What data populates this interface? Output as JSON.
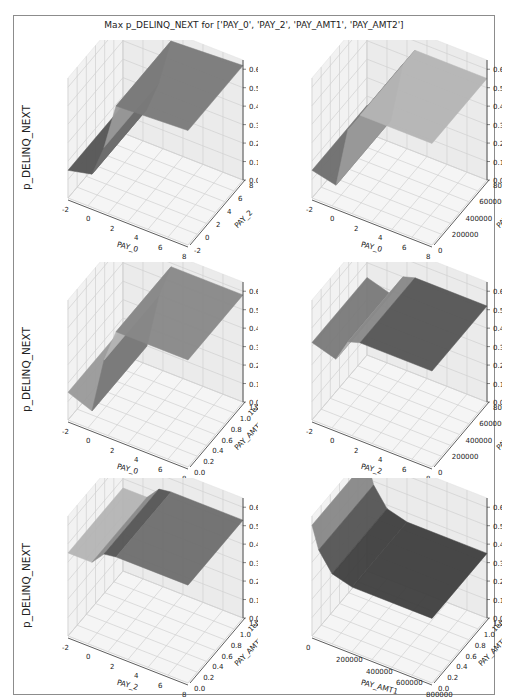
{
  "title": "Max p_DELINQ_NEXT for ['PAY_0', 'PAY_2', 'PAY_AMT1', 'PAY_AMT2']",
  "chart_data": [
    {
      "type": "surface3d",
      "title": "",
      "xlabel": "PAY_0",
      "ylabel": "PAY_2",
      "zlabel": "p_DELINQ_NEXT",
      "xticks": [
        "-2",
        "0",
        "2",
        "4",
        "6",
        "8"
      ],
      "yticks": [
        "-2",
        "0",
        "2",
        "4",
        "6",
        "8"
      ],
      "zticks": [
        "0.0",
        "0.1",
        "0.2",
        "0.3",
        "0.4",
        "0.5",
        "0.6"
      ],
      "zlim": [
        0,
        0.65
      ],
      "description": "Surface low (~0.15) for PAY_0 <= 0, rising stepwise to ~0.6 for PAY_0 >= 2; steps also vary across PAY_2",
      "x": [
        -2,
        0,
        1,
        2,
        8
      ],
      "z_by_x": [
        0.15,
        0.18,
        0.35,
        0.6,
        0.62
      ]
    },
    {
      "type": "surface3d",
      "xlabel": "PAY_0",
      "ylabel": "PAY_AMT1",
      "zlabel": "",
      "xticks": [
        "-2",
        "0",
        "2",
        "4",
        "6",
        "8"
      ],
      "yticks": [
        "0",
        "200000",
        "400000",
        "600000",
        "800000"
      ],
      "zticks": [
        "0.0",
        "0.1",
        "0.2",
        "0.3",
        "0.4",
        "0.5",
        "0.6"
      ],
      "zlim": [
        0,
        0.65
      ],
      "description": "Low (~0.15) for PAY_0 <= 0, rising to ~0.55 for PAY_0 >= 2, dip at low PAY_AMT1",
      "x": [
        -2,
        0,
        1,
        2,
        8
      ],
      "z_by_x": [
        0.15,
        0.12,
        0.45,
        0.55,
        0.55
      ]
    },
    {
      "type": "surface3d",
      "xlabel": "PAY_0",
      "ylabel": "PAY_AMT2",
      "zlabel": "p_DELINQ_NEXT",
      "xticks": [
        "-2",
        "0",
        "2",
        "4",
        "6",
        "8"
      ],
      "yticks": [
        "0.0",
        "0.2",
        "0.4",
        "0.6",
        "0.8",
        "1.0",
        "1.2"
      ],
      "y_offset_label": "1e6",
      "zticks": [
        "0.0",
        "0.1",
        "0.2",
        "0.3",
        "0.4",
        "0.5",
        "0.6"
      ],
      "zlim": [
        0,
        0.65
      ],
      "description": "Low (~0.15) for PAY_0 <= 0, steep rise to ~0.58 for PAY_0 >= 2",
      "x": [
        -2,
        0,
        1,
        2,
        8
      ],
      "z_by_x": [
        0.15,
        0.1,
        0.4,
        0.58,
        0.58
      ]
    },
    {
      "type": "surface3d",
      "xlabel": "PAY_2",
      "ylabel": "PAY_AMT1",
      "zlabel": "",
      "xticks": [
        "-2",
        "0",
        "2",
        "4",
        "6",
        "8"
      ],
      "yticks": [
        "0",
        "200000",
        "400000",
        "600000",
        "800000"
      ],
      "zticks": [
        "0.0",
        "0.1",
        "0.2",
        "0.3",
        "0.4",
        "0.5",
        "0.6"
      ],
      "zlim": [
        0,
        0.65
      ],
      "description": "Mostly flat ~0.45-0.55, small dip near PAY_2 = 0, dark ridge near PAY_2 = 1",
      "x": [
        -2,
        0,
        1,
        2,
        8
      ],
      "z_by_x": [
        0.42,
        0.38,
        0.5,
        0.52,
        0.52
      ]
    },
    {
      "type": "surface3d",
      "xlabel": "PAY_2",
      "ylabel": "PAY_AMT2",
      "zlabel": "p_DELINQ_NEXT",
      "xticks": [
        "-2",
        "0",
        "2",
        "4",
        "6",
        "8"
      ],
      "yticks": [
        "0.0",
        "0.2",
        "0.4",
        "0.6",
        "0.8",
        "1.0",
        "1.2"
      ],
      "y_offset_label": "1e6",
      "zticks": [
        "0.0",
        "0.1",
        "0.2",
        "0.3",
        "0.4",
        "0.5",
        "0.6"
      ],
      "zlim": [
        0,
        0.65
      ],
      "description": "Mostly flat ~0.48-0.55 across PAY_2 and PAY_AMT2",
      "x": [
        -2,
        0,
        1,
        2,
        8
      ],
      "z_by_x": [
        0.45,
        0.45,
        0.52,
        0.53,
        0.53
      ]
    },
    {
      "type": "surface3d",
      "xlabel": "PAY_AMT1",
      "ylabel": "PAY_AMT2",
      "zlabel": "",
      "xticks": [
        "0",
        "200000",
        "400000",
        "600000",
        "800000"
      ],
      "yticks": [
        "0.0",
        "0.2",
        "0.4",
        "0.6",
        "0.8",
        "1.0",
        "1.2"
      ],
      "y_offset_label": "1e6",
      "zticks": [
        "0.0",
        "0.1",
        "0.2",
        "0.3",
        "0.4",
        "0.5",
        "0.6"
      ],
      "zlim": [
        0,
        0.65
      ],
      "description": "High (~0.55-0.6) at PAY_AMT1 near 0, dropping to a flat ~0.35 plane for larger PAY_AMT1",
      "x": [
        0,
        50000,
        150000,
        300000,
        900000
      ],
      "z_by_x": [
        0.6,
        0.48,
        0.38,
        0.35,
        0.35
      ]
    }
  ]
}
